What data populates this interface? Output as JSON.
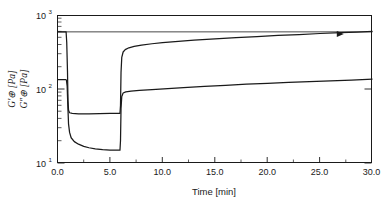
{
  "chart_data": {
    "type": "line",
    "title": "",
    "xlabel": "Time [min]",
    "ylabel_line1": "G′⊕  [Pa]",
    "ylabel_line2": "G″⊕ [Pa]",
    "ylabel_full": "G″⊕ [Pa]   G′⊕  [Pa]",
    "ylabel_sym_gprime": "G′",
    "ylabel_sym_gdoubleprime": "G″",
    "ylabel_marker": "⊕",
    "ylabel_unit": "[Pa]",
    "xlim": [
      0.0,
      30.0
    ],
    "ylim": [
      10,
      1000
    ],
    "yscale": "log",
    "xscale": "linear",
    "grid": false,
    "legend": "none",
    "xticks": [
      "0.0",
      "5.0",
      "10.0",
      "15.0",
      "20.0",
      "25.0",
      "30.0"
    ],
    "xtick_values": [
      0,
      5,
      10,
      15,
      20,
      25,
      30
    ],
    "yticks": [
      "10¹",
      "10²",
      "10³"
    ],
    "ytick_values": [
      10,
      100,
      1000
    ],
    "ytick_mantissa": "10",
    "ytick_exponents": [
      "1",
      "2",
      "3"
    ],
    "reference_line": {
      "label": "",
      "y": 600,
      "x_from": 0.0,
      "x_to": 30.0
    },
    "annotations": [
      {
        "name": "arrow-marker",
        "x": 26.6,
        "y": 560,
        "symbol": "▶"
      }
    ],
    "series": [
      {
        "name": "G'",
        "label": "G′ [Pa]",
        "color": "#1a1a1a",
        "points": [
          [
            0.0,
            600
          ],
          [
            0.78,
            600
          ],
          [
            0.82,
            598
          ],
          [
            0.88,
            430
          ],
          [
            0.95,
            180
          ],
          [
            1.0,
            70
          ],
          [
            1.05,
            52
          ],
          [
            1.15,
            48
          ],
          [
            1.4,
            47
          ],
          [
            2.0,
            46.5
          ],
          [
            3.0,
            46.5
          ],
          [
            4.0,
            46.7
          ],
          [
            5.0,
            47
          ],
          [
            5.8,
            47
          ],
          [
            5.95,
            47
          ],
          [
            6.0,
            60
          ],
          [
            6.05,
            170
          ],
          [
            6.12,
            270
          ],
          [
            6.25,
            320
          ],
          [
            6.45,
            345
          ],
          [
            6.8,
            365
          ],
          [
            7.3,
            382
          ],
          [
            8.0,
            398
          ],
          [
            9.0,
            414
          ],
          [
            10.0,
            428
          ],
          [
            11.5,
            446
          ],
          [
            13.0,
            462
          ],
          [
            15.0,
            481
          ],
          [
            17.0,
            500
          ],
          [
            19.0,
            518
          ],
          [
            21.0,
            536
          ],
          [
            23.0,
            552
          ],
          [
            25.0,
            570
          ],
          [
            27.0,
            586
          ],
          [
            28.5,
            596
          ],
          [
            30.0,
            608
          ]
        ]
      },
      {
        "name": "G''",
        "label": "G″ [Pa]",
        "color": "#1a1a1a",
        "points": [
          [
            0.0,
            135
          ],
          [
            0.8,
            135
          ],
          [
            0.85,
            133
          ],
          [
            0.92,
            110
          ],
          [
            0.98,
            62
          ],
          [
            1.05,
            34
          ],
          [
            1.15,
            26
          ],
          [
            1.3,
            22
          ],
          [
            1.6,
            19.5
          ],
          [
            2.0,
            18.0
          ],
          [
            2.5,
            16.8
          ],
          [
            3.0,
            16.1
          ],
          [
            3.6,
            15.6
          ],
          [
            4.3,
            15.2
          ],
          [
            5.0,
            15.0
          ],
          [
            5.6,
            14.9
          ],
          [
            5.95,
            14.9
          ],
          [
            6.0,
            20
          ],
          [
            6.05,
            55
          ],
          [
            6.12,
            80
          ],
          [
            6.25,
            89
          ],
          [
            6.5,
            92
          ],
          [
            7.0,
            94
          ],
          [
            7.8,
            96.5
          ],
          [
            9.0,
            99
          ],
          [
            10.5,
            102
          ],
          [
            12.0,
            105
          ],
          [
            14.0,
            109
          ],
          [
            16.0,
            113
          ],
          [
            18.0,
            117
          ],
          [
            20.0,
            120
          ],
          [
            22.0,
            124
          ],
          [
            24.0,
            127
          ],
          [
            26.0,
            130
          ],
          [
            28.0,
            133
          ],
          [
            30.0,
            137
          ]
        ]
      }
    ]
  },
  "figure": {
    "plot_left_px": 57,
    "plot_right_px": 372,
    "plot_top_px": 15,
    "plot_bottom_px": 163
  }
}
